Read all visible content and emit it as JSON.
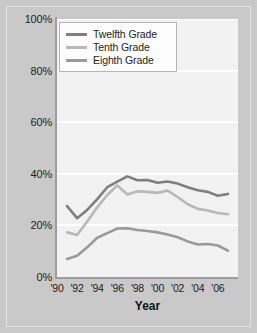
{
  "chart_data": {
    "type": "line",
    "title": "",
    "xlabel": "Year",
    "ylabel": "",
    "xlim": [
      1990,
      2008
    ],
    "ylim": [
      0,
      100
    ],
    "grid": true,
    "legend_position": "top-left",
    "x": [
      1991,
      1992,
      1993,
      1994,
      1995,
      1996,
      1997,
      1998,
      1999,
      2000,
      2001,
      2002,
      2003,
      2004,
      2005,
      2006,
      2007
    ],
    "xticks": [
      1990,
      1992,
      1994,
      1996,
      1998,
      2000,
      2002,
      2004,
      2006
    ],
    "xtick_labels": [
      "'90",
      "'92",
      "'94",
      "'96",
      "'98",
      "'00",
      "'02",
      "'04",
      "'06"
    ],
    "yticks": [
      0,
      20,
      40,
      60,
      80,
      100
    ],
    "ytick_labels": [
      "0%",
      "20%",
      "40%",
      "60%",
      "80%",
      "100%"
    ],
    "series": [
      {
        "name": "Twelfth Grade",
        "color": "#7f7f7f",
        "values": [
          27.5,
          22.8,
          26.0,
          30.2,
          34.8,
          37.0,
          39.0,
          37.5,
          37.6,
          36.5,
          37.0,
          36.2,
          34.8,
          33.6,
          33.0,
          31.5,
          32.2
        ]
      },
      {
        "name": "Tenth Grade",
        "color": "#b8b8b8",
        "values": [
          17.3,
          16.3,
          21.5,
          27.0,
          31.8,
          35.5,
          32.0,
          33.2,
          33.0,
          32.6,
          33.5,
          31.0,
          28.2,
          26.4,
          25.8,
          24.8,
          24.3
        ]
      },
      {
        "name": "Eighth Grade",
        "color": "#9a9a9a",
        "values": [
          7.0,
          8.2,
          11.5,
          15.2,
          17.0,
          18.8,
          18.9,
          18.2,
          17.8,
          17.3,
          16.5,
          15.4,
          13.8,
          12.6,
          12.8,
          12.2,
          10.2
        ]
      }
    ]
  },
  "legend": {
    "items": [
      {
        "label": "Twelfth Grade"
      },
      {
        "label": "Tenth Grade"
      },
      {
        "label": "Eighth Grade"
      }
    ]
  },
  "colors": {
    "page_background": "#c9c9c9",
    "plot_background": "#f2f2f2",
    "gridline": "#ffffff",
    "axis": "#9d9d9d",
    "text": "#1d1d1d"
  }
}
